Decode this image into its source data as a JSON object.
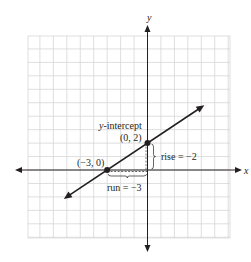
{
  "diagram": {
    "type": "coordinate-graph-line",
    "axes": {
      "x_label": "x",
      "y_label": "y",
      "grid": true,
      "x_range": [
        -9,
        6
      ],
      "y_range": [
        -5,
        10
      ]
    },
    "line": {
      "equation_points": [
        [
          -3,
          0
        ],
        [
          0,
          2
        ]
      ],
      "extends_from_x": -6,
      "extends_to_x": 4
    },
    "points": [
      {
        "x": -3,
        "y": 0,
        "label": "(−3, 0)"
      },
      {
        "x": 0,
        "y": 2,
        "label": "(0, 2)"
      }
    ],
    "annotations": {
      "y_intercept_prefix": "y",
      "y_intercept_suffix": "-intercept",
      "rise_label": "rise = −2",
      "run_label": "run = −3"
    },
    "colors": {
      "grid": "#d6d6d6",
      "ink": "#231f20"
    }
  }
}
